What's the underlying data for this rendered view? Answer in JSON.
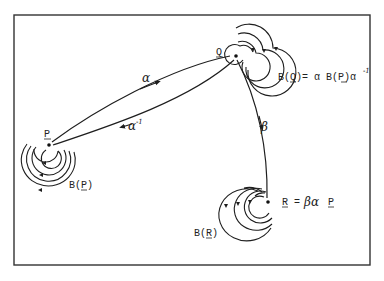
{
  "diagram": {
    "nodes": [
      {
        "id": "P",
        "label": "P"
      },
      {
        "id": "Q",
        "label": "Q"
      },
      {
        "id": "R",
        "label": "R"
      }
    ],
    "edges": [
      {
        "from": "P",
        "to": "Q",
        "label": "α"
      },
      {
        "from": "Q",
        "to": "P",
        "label": "α",
        "label_sup": "-1"
      },
      {
        "from": "Q",
        "to": "R",
        "label": "β"
      }
    ],
    "annotations": {
      "bq": {
        "pre": "B(",
        "node": "Q",
        "mid": ")= α B(",
        "node2": "P",
        "post": ")α",
        "sup": "-1"
      },
      "bp": {
        "pre": "B(",
        "node": "P",
        "post": ")"
      },
      "br": {
        "pre": "B(",
        "node": "R",
        "post": ")"
      },
      "r_eq": {
        "node": "R",
        "eq": " = ",
        "greek": "βα",
        "node2": "P"
      }
    },
    "loops": [
      {
        "node": "P",
        "count": 3
      },
      {
        "node": "Q",
        "count": 3
      },
      {
        "node": "R",
        "count": 3
      }
    ]
  }
}
